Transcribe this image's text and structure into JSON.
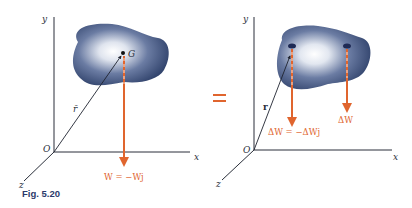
{
  "caption": "Fig. 5.20",
  "left_panel": {
    "axes": {
      "y": "y",
      "x": "x",
      "z": "z",
      "origin": "O"
    },
    "point_label": "G",
    "position_vector": "r̄",
    "force_label": "W = −Wj"
  },
  "equals_sign": "=",
  "right_panel": {
    "axes": {
      "y": "y",
      "x": "x",
      "z": "z",
      "origin": "O"
    },
    "position_vector": "r",
    "force_label_1": "ΔW = −ΔWj",
    "force_label_2": "ΔW"
  },
  "colors": {
    "force": "#e0652e",
    "body_dark": "#3c4f7a",
    "body_light": "#ffffff",
    "axis": "#2a2f3a",
    "caption": "#2b3a6b"
  }
}
